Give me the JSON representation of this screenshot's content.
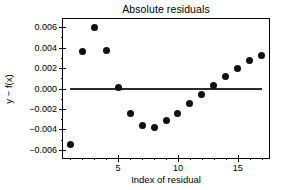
{
  "chart_data": {
    "type": "scatter",
    "title": "Absolute residuals",
    "xlabel": "Index of residual",
    "ylabel": "y − f(x)",
    "xlim": [
      0.4,
      17.6
    ],
    "ylim": [
      -0.0068,
      0.0068
    ],
    "grid": false,
    "legend": null,
    "x": [
      1,
      2,
      3,
      4,
      5,
      6,
      7,
      8,
      9,
      10,
      11,
      12,
      13,
      14,
      15,
      16,
      17
    ],
    "y": [
      -0.0055,
      0.0036,
      0.006,
      0.0037,
      0.0001,
      -0.0024,
      -0.0036,
      -0.0038,
      -0.0031,
      -0.0024,
      -0.0015,
      -0.0006,
      0.0003,
      0.0012,
      0.002,
      0.0027,
      0.0032
    ],
    "xticks": [
      5,
      10,
      15
    ],
    "xtick_labels": [
      "5",
      "10",
      "15"
    ],
    "xminor_ticks": [
      1,
      2,
      3,
      4,
      6,
      7,
      8,
      9,
      11,
      12,
      13,
      14,
      16,
      17
    ],
    "yticks": [
      0.006,
      0.004,
      0.002,
      0.0,
      -0.002,
      -0.004,
      -0.006
    ],
    "ytick_labels": [
      "0.006",
      "0.004",
      "0.002",
      "0.000",
      "−0.002",
      "−0.004",
      "−0.006"
    ],
    "yminor_ticks": [
      0.005,
      0.003,
      0.001,
      -0.001,
      -0.003,
      -0.005
    ],
    "reference_line": {
      "y": 0.0,
      "x_start": 1.0,
      "x_end": 17.0,
      "color": "#2b2b2b"
    },
    "marker": {
      "shape": "circle",
      "color": "#111111",
      "size_px": 7
    },
    "background_color": "#ffffff",
    "frame_color": "#000000"
  }
}
